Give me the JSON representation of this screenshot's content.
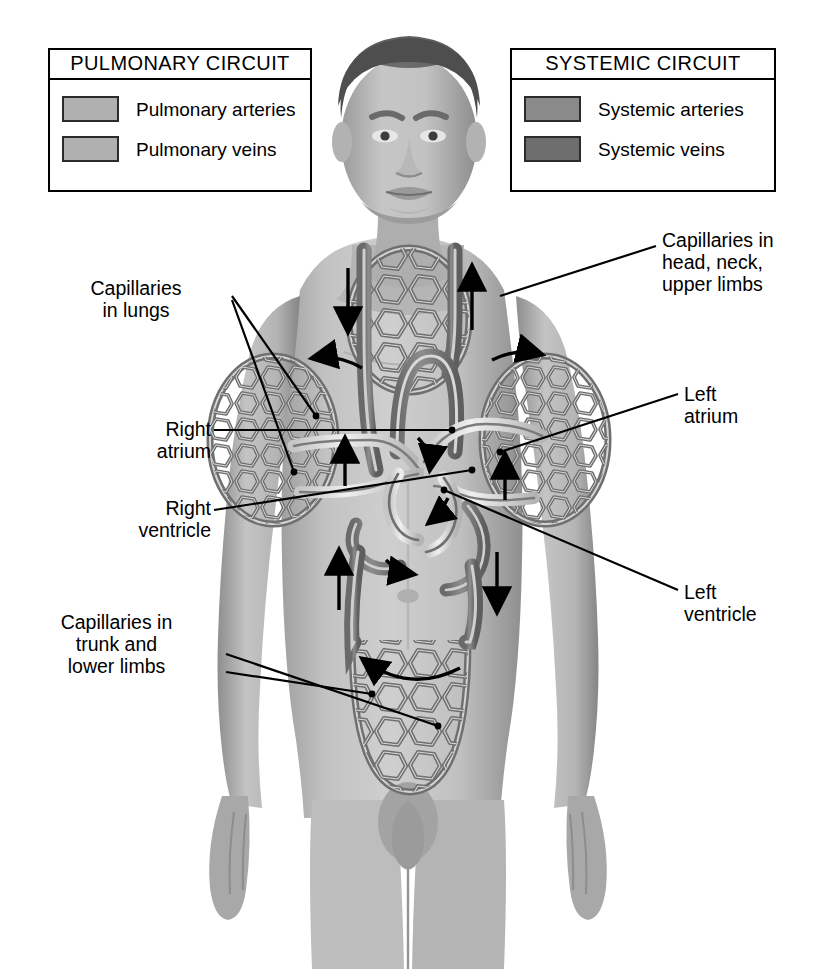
{
  "figure": {
    "kind": "anatomical-diagram",
    "background_color": "#ffffff",
    "line_color": "#000000",
    "body_tone_light": "#c9c9c9",
    "body_tone_mid": "#a9a9a9",
    "body_tone_dark": "#7e7e7e",
    "hair_color": "#5a5a5a"
  },
  "legends": [
    {
      "id": "pulmonary",
      "title": "PULMONARY CIRCUIT",
      "rows": [
        {
          "label": "Pulmonary arteries",
          "color": "#b0b0b0",
          "border": "#2b2b2b"
        },
        {
          "label": "Pulmonary veins",
          "color": "#b0b0b0",
          "border": "#2b2b2b"
        }
      ]
    },
    {
      "id": "systemic",
      "title": "SYSTEMIC CIRCUIT",
      "rows": [
        {
          "label": "Systemic arteries",
          "color": "#8a8a8a",
          "border": "#2b2b2b"
        },
        {
          "label": "Systemic veins",
          "color": "#6e6e6e",
          "border": "#2b2b2b"
        }
      ]
    }
  ],
  "callouts": [
    {
      "id": "capillaries-lungs",
      "text": "Capillaries\nin lungs",
      "align": "center"
    },
    {
      "id": "capillaries-head",
      "text": "Capillaries in\nhead, neck,\nupper limbs",
      "align": "left"
    },
    {
      "id": "right-atrium",
      "text": "Right\natrium",
      "align": "right"
    },
    {
      "id": "right-ventricle",
      "text": "Right\nventricle",
      "align": "right"
    },
    {
      "id": "left-atrium",
      "text": "Left\natrium",
      "align": "left"
    },
    {
      "id": "left-ventricle",
      "text": "Left\nventricle",
      "align": "left"
    },
    {
      "id": "capillaries-trunk",
      "text": "Capillaries in\ntrunk and\nlower limbs",
      "align": "center"
    }
  ],
  "flow_arrows": [
    {
      "id": "superior-vena-cava-down",
      "direction": "down",
      "x": 348,
      "y": 300
    },
    {
      "id": "head-return-up",
      "direction": "up",
      "x": 470,
      "y": 300
    },
    {
      "id": "pulmonary-left-out",
      "direction": "left",
      "x": 330,
      "y": 368
    },
    {
      "id": "pulmonary-right-out",
      "direction": "right",
      "x": 505,
      "y": 368
    },
    {
      "id": "left-lung-return-up",
      "direction": "up",
      "x": 345,
      "y": 450
    },
    {
      "id": "right-lung-return-up",
      "direction": "up",
      "x": 500,
      "y": 470
    },
    {
      "id": "vena-cava-up",
      "direction": "up",
      "x": 340,
      "y": 575
    },
    {
      "id": "aorta-down",
      "direction": "down",
      "x": 497,
      "y": 575
    },
    {
      "id": "lower-body-loop",
      "direction": "left",
      "x": 410,
      "y": 655
    }
  ]
}
